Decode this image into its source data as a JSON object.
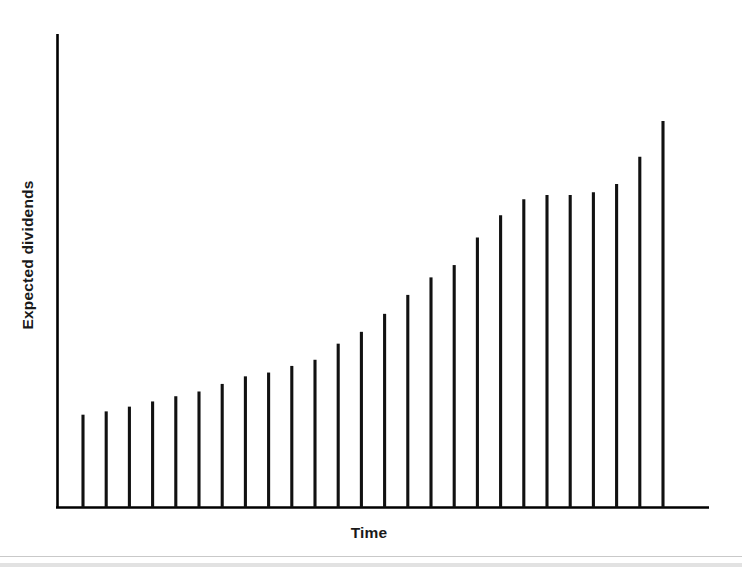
{
  "chart_data": {
    "type": "bar",
    "title": "",
    "xlabel": "Time",
    "ylabel": "Expected dividends",
    "grid": false,
    "legend": false,
    "axis_style": "open-left-bottom-spines",
    "bar_style": "thin-vertical-lines",
    "xlim": [
      0,
      27
    ],
    "ylim": [
      0,
      100
    ],
    "x_tick_labels": [],
    "y_tick_labels": [],
    "categories": [
      "1",
      "2",
      "3",
      "4",
      "5",
      "6",
      "7",
      "8",
      "9",
      "10",
      "11",
      "12",
      "13",
      "14",
      "15",
      "16",
      "17",
      "18",
      "19",
      "20",
      "21",
      "22",
      "23",
      "24",
      "25",
      "26"
    ],
    "values": [
      19.6,
      20.3,
      21.3,
      22.4,
      23.5,
      24.5,
      26.1,
      27.7,
      28.5,
      29.9,
      31.2,
      34.6,
      37.1,
      40.9,
      44.9,
      48.6,
      51.2,
      57.0,
      61.7,
      65.1,
      66.0,
      66.0,
      66.6,
      68.3,
      74.1,
      81.6
    ],
    "bar_color": "#111111",
    "axis_color": "#000000",
    "background_color": "#ffffff",
    "note": "Values are percent of plot height measured from the baseline; axis carries no numeric tick labels."
  },
  "figure": {
    "xlabel": "Time",
    "ylabel": "Expected dividends"
  }
}
